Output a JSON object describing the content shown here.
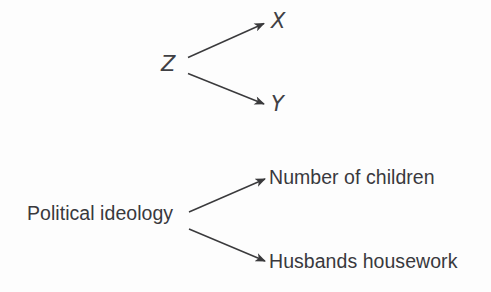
{
  "figure": {
    "background_color": "#fdfdfd",
    "line_color": "#3a3a3c",
    "text_color": "#39393d"
  },
  "diagrams": [
    {
      "id": "abstract-confounder",
      "style": "italic-variables",
      "nodes": {
        "cause": "Z",
        "outcome_top": "X",
        "outcome_bottom": "Y"
      },
      "edges": [
        {
          "from": "Z",
          "to": "X",
          "arrowhead": "solid-triangle"
        },
        {
          "from": "Z",
          "to": "Y",
          "arrowhead": "solid-triangle"
        }
      ]
    },
    {
      "id": "applied-confounder",
      "style": "plain-text-variables",
      "nodes": {
        "cause": "Political ideology",
        "outcome_top": "Number of children",
        "outcome_bottom": "Husbands housework"
      },
      "edges": [
        {
          "from": "Political ideology",
          "to": "Number of children",
          "arrowhead": "solid-triangle"
        },
        {
          "from": "Political ideology",
          "to": "Husbands housework",
          "arrowhead": "solid-triangle"
        }
      ]
    }
  ]
}
